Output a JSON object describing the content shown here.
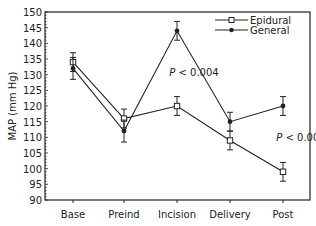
{
  "chart_data": {
    "type": "line",
    "title": "",
    "xlabel": "",
    "ylabel": "MAP (mm Hg)",
    "categories": [
      "Base",
      "Preind",
      "Incision",
      "Delivery",
      "Post"
    ],
    "ylim": [
      90,
      150
    ],
    "yticks": [
      90,
      95,
      100,
      105,
      110,
      115,
      120,
      125,
      130,
      135,
      140,
      145,
      150
    ],
    "grid": false,
    "legend_position": "upper right",
    "series": [
      {
        "name": "Epidural",
        "marker": "open-square",
        "values": [
          134,
          116,
          120,
          109,
          99
        ],
        "error": [
          3,
          3,
          3,
          3,
          3
        ]
      },
      {
        "name": "General",
        "marker": "filled-circle",
        "values": [
          132,
          112,
          144,
          115,
          120
        ],
        "error": [
          3.5,
          3.5,
          3,
          3,
          3
        ]
      }
    ],
    "annotations": [
      {
        "text": "P < 0.004",
        "category": "Incision",
        "y": 131
      },
      {
        "text": "P < 0.009",
        "category": "Post",
        "y": 110
      }
    ]
  }
}
